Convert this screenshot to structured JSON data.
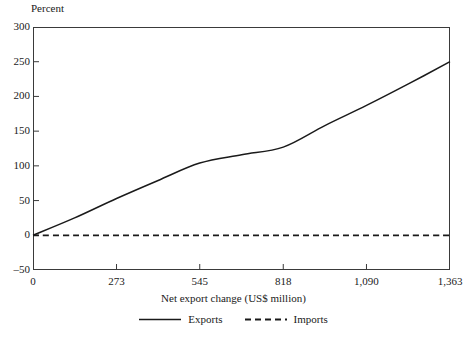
{
  "chart_data": {
    "type": "line",
    "title": "",
    "xlabel": "Net export change (US$ million)",
    "ylabel": "Percent",
    "xlim": [
      0,
      1363
    ],
    "ylim": [
      -50,
      300
    ],
    "grid": false,
    "legend_position": "bottom",
    "x_ticks": [
      0,
      273,
      545,
      818,
      1090,
      1363
    ],
    "x_tick_labels": [
      "0",
      "273",
      "545",
      "818",
      "1,090",
      "1,363"
    ],
    "y_ticks": [
      -50,
      0,
      50,
      100,
      150,
      200,
      250,
      300
    ],
    "y_tick_labels": [
      "-50",
      "0",
      "50",
      "100",
      "150",
      "200",
      "250",
      "300"
    ],
    "x": [
      0,
      136,
      273,
      409,
      545,
      682,
      818,
      954,
      1090,
      1227,
      1363
    ],
    "series": [
      {
        "name": "Exports",
        "style": "solid",
        "color": "#1a1a1a",
        "values": [
          0,
          25,
          53,
          79,
          104,
          116,
          127,
          158,
          187,
          218,
          250
        ]
      },
      {
        "name": "Imports",
        "style": "dashed",
        "color": "#1a1a1a",
        "values": [
          0,
          0,
          0,
          0,
          0,
          0,
          0,
          0,
          0,
          0,
          0
        ]
      }
    ]
  },
  "legend": {
    "entries": [
      {
        "label": "Exports",
        "style": "solid"
      },
      {
        "label": "Imports",
        "style": "dashed"
      }
    ]
  },
  "axes": {
    "y_title": "Percent",
    "x_title": "Net export change (US$ million)"
  }
}
